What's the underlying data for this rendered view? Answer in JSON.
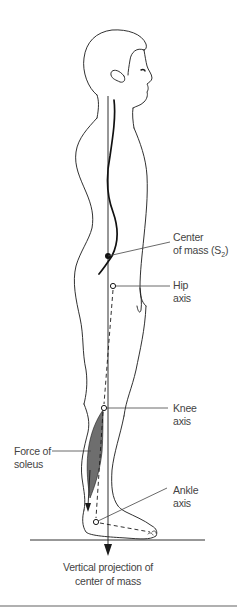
{
  "diagram": {
    "type": "biomechanics-posture-figure",
    "colors": {
      "outline": "#1a1a1a",
      "label_text": "#444444",
      "soleus_fill": "#6e6e6e",
      "bottom_rule": "#b0b0b0"
    }
  },
  "labels": {
    "center_of_mass": {
      "line1": "Center",
      "line2_prefix": "of mass (S",
      "line2_sub": "2",
      "line2_suffix": ")"
    },
    "hip_axis": {
      "line1": "Hip",
      "line2": "axis"
    },
    "knee_axis": {
      "line1": "Knee",
      "line2": "axis"
    },
    "force_of_soleus": {
      "line1": "Force of",
      "line2": "soleus"
    },
    "ankle_axis": {
      "line1": "Ankle",
      "line2": "axis"
    }
  },
  "caption": {
    "line1": "Vertical projection of",
    "line2": "center of mass"
  }
}
